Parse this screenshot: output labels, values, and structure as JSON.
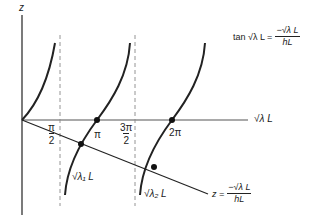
{
  "diagram": {
    "axes": {
      "y_label": "z",
      "x_label": "√λ L"
    },
    "tick_labels": {
      "half_pi_num": "π",
      "half_pi_den": "2",
      "pi": "π",
      "three_half_pi_num": "3π",
      "three_half_pi_den": "2",
      "two_pi": "2π"
    },
    "intersection_labels": {
      "root1": "√λ₁ L",
      "root2": "√λ₂ L"
    },
    "equations": {
      "tan_lhs": "tan √λ L =",
      "tan_rhs_num": "−√λ L",
      "tan_rhs_den": "hL",
      "line_lhs": "z =",
      "line_rhs_num": "−√λ L",
      "line_rhs_den": "hL"
    },
    "colors": {
      "stroke": "#222222",
      "dashed": "#888888",
      "background": "#ffffff"
    }
  }
}
